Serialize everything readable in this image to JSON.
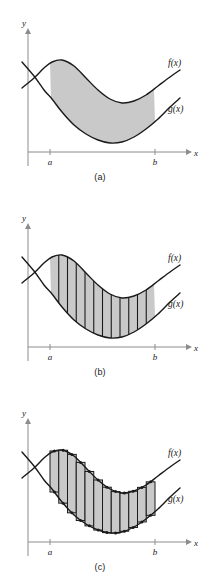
{
  "figure": {
    "colors": {
      "shade": "#c9c9c9",
      "stroke": "#1a1a1a",
      "axis": "#8c8c8c",
      "background": "#ffffff"
    }
  },
  "labels": {
    "y_axis": "y",
    "x_axis": "x",
    "tick_a": "a",
    "tick_b": "b",
    "curve_f": "f(x)",
    "curve_g": "g(x)"
  },
  "panels": [
    {
      "id": "a",
      "caption": "(a)",
      "kind": "shaded-region",
      "strips": 0,
      "rectangles": 0
    },
    {
      "id": "b",
      "caption": "(b)",
      "kind": "vertical-strips",
      "strips": 12,
      "rectangles": 0
    },
    {
      "id": "c",
      "caption": "(c)",
      "kind": "riemann-rectangles",
      "strips": 0,
      "rectangles": 12
    }
  ],
  "chart_data": {
    "type": "line",
    "xlabel": "x",
    "ylabel": "y",
    "grid": false,
    "legend": "inline-curve-labels",
    "interval": {
      "a": "a",
      "b": "b",
      "a_px": 50,
      "b_px": 155
    },
    "series": [
      {
        "name": "f(x)",
        "note": "upper curve; rises to a maximum near x=a+, dips to a minimum near right-center, rises again toward b",
        "points_px": [
          [
            22,
            88
          ],
          [
            34,
            78
          ],
          [
            44,
            68
          ],
          [
            52,
            62
          ],
          [
            62,
            60
          ],
          [
            74,
            66
          ],
          [
            86,
            78
          ],
          [
            98,
            90
          ],
          [
            110,
            99
          ],
          [
            122,
            103
          ],
          [
            134,
            101
          ],
          [
            146,
            95
          ],
          [
            158,
            86
          ],
          [
            170,
            77
          ],
          [
            180,
            70
          ]
        ]
      },
      {
        "name": "g(x)",
        "note": "lower curve; descends from upper-left, reaches a minimum near right-center, then rises toward b",
        "points_px": [
          [
            22,
            62
          ],
          [
            34,
            76
          ],
          [
            44,
            90
          ],
          [
            52,
            99
          ],
          [
            62,
            112
          ],
          [
            74,
            125
          ],
          [
            86,
            134
          ],
          [
            98,
            140
          ],
          [
            110,
            143
          ],
          [
            122,
            142
          ],
          [
            134,
            137
          ],
          [
            146,
            129
          ],
          [
            158,
            119
          ],
          [
            170,
            107
          ],
          [
            180,
            98
          ]
        ]
      }
    ],
    "annotations": [
      {
        "text": "f(x)",
        "x_px": 168,
        "y_px": 66
      },
      {
        "text": "g(x)",
        "x_px": 168,
        "y_px": 112
      },
      {
        "text": "a",
        "x_px": 50,
        "y_px": 170
      },
      {
        "text": "b",
        "x_px": 155,
        "y_px": 170
      }
    ]
  }
}
